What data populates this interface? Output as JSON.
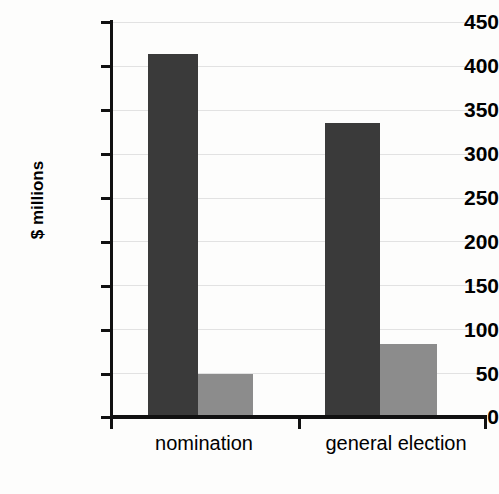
{
  "chart_data": {
    "type": "bar",
    "title": "",
    "xlabel": "",
    "ylabel": "$ millions",
    "categories": [
      "nomination",
      "general election"
    ],
    "series": [
      {
        "name": "series-1",
        "color": "#3a3a3a",
        "values": [
          414,
          335
        ]
      },
      {
        "name": "series-2",
        "color": "#8c8c8c",
        "values": [
          49,
          83
        ]
      }
    ],
    "ylim": [
      0,
      450
    ],
    "ytick_step": 50,
    "ytick_labels": [
      "450",
      "400",
      "350",
      "300",
      "250",
      "200",
      "150",
      "100",
      "50",
      "0"
    ],
    "ytick_values": [
      450,
      400,
      350,
      300,
      250,
      200,
      150,
      100,
      50,
      0
    ],
    "grid": true,
    "grid_axis": "y",
    "legend": "none",
    "legend_position": "none"
  },
  "axes": {
    "y_title": "$ millions",
    "y_labels": {
      "t450": "450",
      "t400": "400",
      "t350": "350",
      "t300": "300",
      "t250": "250",
      "t200": "200",
      "t150": "150",
      "t100": "100",
      "t50": "50",
      "t0": "0"
    },
    "x_labels": {
      "cat1": "nomination",
      "cat2": "general election"
    }
  },
  "colors": {
    "bar_dark": "#3a3a3a",
    "bar_light": "#8c8c8c",
    "gridline": "#e2e2e2",
    "axis": "#111111",
    "background": "#fdfdfc"
  }
}
